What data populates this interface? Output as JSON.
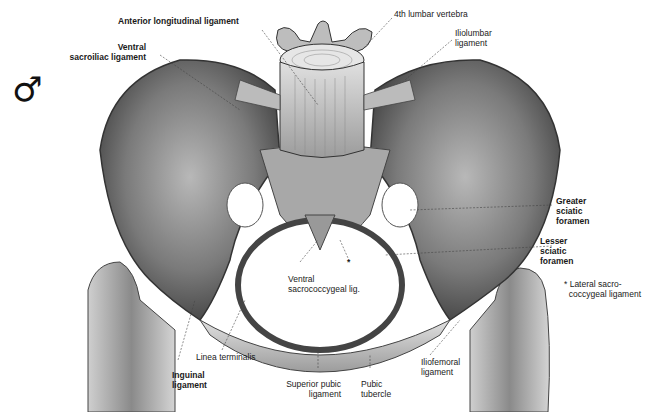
{
  "figure": {
    "sex_symbol": "♂",
    "colors": {
      "background": "#ffffff",
      "bone_light": "#d8d8d8",
      "bone_mid": "#9a9a9a",
      "bone_dark": "#555555",
      "label": "#1a1a1a"
    }
  },
  "labels": {
    "anterior_longitudinal": "Anterior longitudinal ligament",
    "fourth_lumbar": "4th lumbar vertebra",
    "iliolumbar": "Iliolumbar\nligament",
    "ventral_sacroiliac": "Ventral\nsacroiliac ligament",
    "greater_sciatic": "Greater\nsciatic\nforamen",
    "lesser_sciatic": "Lesser\nsciatic\nforamen",
    "ventral_sacrococcygeal": "Ventral\nsacrococcygeal lig.",
    "asterisk": "*",
    "lateral_sacrococcygeal": "* Lateral sacro-\n  coccygeal ligament",
    "linea_terminalis": "Linea terminalis",
    "inguinal": "Inguinal\nligament",
    "superior_pubic": "Superior pubic\nligament",
    "pubic_tubercle": "Pubic\ntubercle",
    "iliofemoral": "Iliofemoral\nligament"
  }
}
